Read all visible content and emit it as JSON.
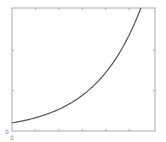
{
  "chart_data": {
    "type": "line",
    "title": "",
    "xlabel": "",
    "ylabel": "",
    "xlim": [
      0,
      6.1
    ],
    "ylim": [
      0,
      3.05
    ],
    "x_ticks": [
      0,
      1,
      2,
      3,
      4,
      5
    ],
    "y_ticks": [
      0,
      1,
      2
    ],
    "x_tick_labels": [
      "0"
    ],
    "y_tick_labels": [
      "0"
    ],
    "grid": false,
    "legend": null,
    "series": [
      {
        "name": "curve",
        "color": "#555555",
        "x": [
          0,
          0.5,
          1,
          1.5,
          2,
          2.5,
          3,
          3.5,
          4,
          4.5,
          5,
          5.5,
          5.45
        ],
        "values": [
          0.2,
          0.27,
          0.35,
          0.45,
          0.55,
          0.7,
          0.85,
          1.12,
          1.45,
          1.9,
          2.45,
          3.05,
          3.05
        ]
      }
    ]
  },
  "style": {
    "axis_color": "#aaaaaa",
    "line_color": "#555555",
    "background": "#ffffff"
  }
}
